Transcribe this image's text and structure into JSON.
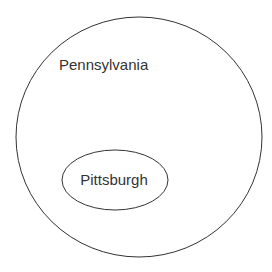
{
  "diagram": {
    "type": "euler",
    "outer": {
      "label": "Pennsylvania",
      "shape": "circle",
      "cx": 139,
      "cy": 137,
      "rx": 123,
      "ry": 120,
      "label_x": 59,
      "label_y": 70
    },
    "inner": {
      "label": "Pittsburgh",
      "shape": "ellipse",
      "cx": 115,
      "cy": 180,
      "rx": 53,
      "ry": 30,
      "label_x": 114,
      "label_y": 185
    },
    "stroke_color": "#333333",
    "background": "#ffffff"
  }
}
